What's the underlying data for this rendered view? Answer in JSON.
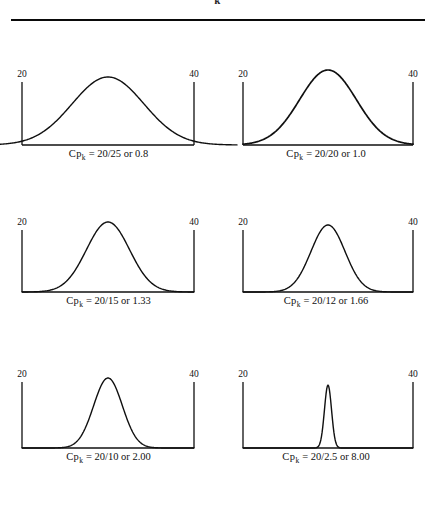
{
  "figure": {
    "top_cropped_text": "k",
    "divider": true,
    "axis_low_label": "20",
    "axis_high_label": "40",
    "symbol_prefix": "Cp",
    "symbol_subscript": "k",
    "equals": "=",
    "or_word": "or"
  },
  "chart_data": {
    "type": "line",
    "xlabel": "",
    "ylabel": "",
    "xlim": [
      20,
      40
    ],
    "grid": false,
    "legend": false,
    "spec_limits": {
      "lower": 20,
      "upper": 40,
      "lower_label": "20",
      "upper_label": "40"
    },
    "panels": [
      {
        "index": 1,
        "position": "top-left",
        "caption": "Cp_k = 20/25 or 0.8",
        "cpk_label": "20/25 or 0.8",
        "tolerance": 20,
        "process_spread": 25,
        "cpk": 0.8,
        "mean": 30,
        "sigma": 4.1667,
        "curve": "normal",
        "fits_within_limits": false,
        "tails_exceed_limits": true
      },
      {
        "index": 2,
        "position": "top-right",
        "caption": "Cp_k = 20/20 or 1.0",
        "cpk_label": "20/20 or 1.0",
        "tolerance": 20,
        "process_spread": 20,
        "cpk": 1.0,
        "mean": 30,
        "sigma": 3.3333,
        "curve": "normal",
        "fits_within_limits": true,
        "tails_exceed_limits": false
      },
      {
        "index": 3,
        "position": "middle-left",
        "caption": "Cp_k = 20/15 or 1.33",
        "cpk_label": "20/15 or 1.33",
        "tolerance": 20,
        "process_spread": 15,
        "cpk": 1.33,
        "mean": 30,
        "sigma": 2.5,
        "curve": "normal",
        "fits_within_limits": true,
        "tails_exceed_limits": false
      },
      {
        "index": 4,
        "position": "middle-right",
        "caption": "Cp_k = 20/12 or 1.66",
        "cpk_label": "20/12 or 1.66",
        "tolerance": 20,
        "process_spread": 12,
        "cpk": 1.66,
        "mean": 30,
        "sigma": 2.0,
        "curve": "normal",
        "fits_within_limits": true,
        "tails_exceed_limits": false
      },
      {
        "index": 5,
        "position": "bottom-left",
        "caption": "Cp_k = 20/10 or 2.00",
        "cpk_label": "20/10 or 2.00",
        "tolerance": 20,
        "process_spread": 10,
        "cpk": 2.0,
        "mean": 30,
        "sigma": 1.6667,
        "curve": "normal",
        "fits_within_limits": true,
        "tails_exceed_limits": false
      },
      {
        "index": 6,
        "position": "bottom-right",
        "caption": "Cp_k = 20/2.5 or 8.00",
        "cpk_label": "20/2.5 or 8.00",
        "tolerance": 20,
        "process_spread": 2.5,
        "cpk": 8.0,
        "mean": 30,
        "sigma": 0.41667,
        "curve": "normal",
        "fits_within_limits": true,
        "tails_exceed_limits": false
      }
    ]
  },
  "panels_text": [
    {
      "num": "20/25",
      "val": "0.8"
    },
    {
      "num": "20/20",
      "val": "1.0"
    },
    {
      "num": "20/15",
      "val": "1.33"
    },
    {
      "num": "20/12",
      "val": "1.66"
    },
    {
      "num": "20/10",
      "val": "2.00"
    },
    {
      "num": "20/2.5",
      "val": "8.00"
    }
  ],
  "colors": {
    "ink": "#101010",
    "rule": "#0a0a0a",
    "background": "#ffffff"
  }
}
